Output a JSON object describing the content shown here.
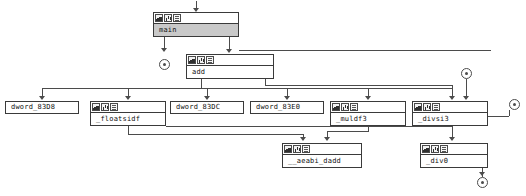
{
  "graph": {
    "kind": "function-call-graph",
    "node_icons": [
      "window-icon",
      "chart-icon",
      "list-icon"
    ],
    "nodes": [
      {
        "id": "main",
        "label": "main",
        "style": "shaded",
        "x": 153,
        "y": 12,
        "w": 86,
        "h": 25
      },
      {
        "id": "add",
        "label": "add",
        "style": "light",
        "x": 186,
        "y": 54,
        "w": 88,
        "h": 25
      },
      {
        "id": "dword_83D8",
        "label": "dword_83D8",
        "style": "plain",
        "x": 5,
        "y": 101,
        "w": 74,
        "h": 13
      },
      {
        "id": "floatsidf",
        "label": "_floatsidf",
        "style": "light",
        "x": 90,
        "y": 101,
        "w": 76,
        "h": 25
      },
      {
        "id": "dword_83DC",
        "label": "dword_83DC",
        "style": "plain",
        "x": 170,
        "y": 101,
        "w": 74,
        "h": 13
      },
      {
        "id": "dword_83E0",
        "label": "dword_83E0",
        "style": "plain",
        "x": 250,
        "y": 101,
        "w": 74,
        "h": 13
      },
      {
        "id": "muldf3",
        "label": "_muldf3",
        "style": "light",
        "x": 330,
        "y": 101,
        "w": 76,
        "h": 25
      },
      {
        "id": "divsi3",
        "label": "_divsi3",
        "style": "light",
        "x": 412,
        "y": 101,
        "w": 76,
        "h": 25
      },
      {
        "id": "aeabi_dadd",
        "label": "__aeabi_dadd",
        "style": "light",
        "x": 282,
        "y": 143,
        "w": 80,
        "h": 25
      },
      {
        "id": "div0",
        "label": "_div0",
        "style": "light",
        "x": 420,
        "y": 143,
        "w": 68,
        "h": 25
      }
    ],
    "terminators": [
      {
        "id": "term-main-return",
        "x": 159,
        "y": 59
      },
      {
        "id": "term-divsi3-in",
        "x": 461,
        "y": 68
      },
      {
        "id": "term-divsi3-side",
        "x": 509,
        "y": 99
      },
      {
        "id": "term-div0-out",
        "x": 477,
        "y": 177
      }
    ],
    "edges": [
      {
        "from": "entry",
        "to": "main"
      },
      {
        "from": "main",
        "to": "term-main-return"
      },
      {
        "from": "main",
        "to": "add"
      },
      {
        "from": "add",
        "to": "dword_83D8"
      },
      {
        "from": "add",
        "to": "floatsidf"
      },
      {
        "from": "add",
        "to": "dword_83DC"
      },
      {
        "from": "add",
        "to": "dword_83E0"
      },
      {
        "from": "add",
        "to": "muldf3"
      },
      {
        "from": "add",
        "to": "divsi3"
      },
      {
        "from": "floatsidf",
        "to": "aeabi_dadd"
      },
      {
        "from": "muldf3",
        "to": "aeabi_dadd"
      },
      {
        "from": "term-divsi3-in",
        "to": "divsi3"
      },
      {
        "from": "divsi3",
        "to": "term-divsi3-side"
      },
      {
        "from": "divsi3",
        "to": "div0"
      },
      {
        "from": "div0",
        "to": "term-div0-out"
      }
    ]
  }
}
